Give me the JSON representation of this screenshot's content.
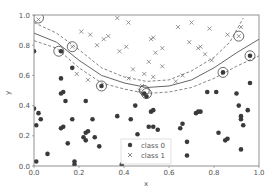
{
  "chart_data": {
    "type": "scatter",
    "title": "",
    "xlabel": "x",
    "ylabel": "y",
    "xlim": [
      0.0,
      1.0
    ],
    "ylim": [
      0.0,
      1.0
    ],
    "xticks": [
      "0.0",
      "0.2",
      "0.4",
      "0.6",
      "0.8",
      "1.0"
    ],
    "yticks": [
      "0.0",
      "0.2",
      "0.4",
      "0.6",
      "0.8",
      "1.0"
    ],
    "grid": false,
    "legend": {
      "position": "lower center",
      "entries": [
        "class 0",
        "class 1"
      ]
    },
    "series": [
      {
        "name": "class 0",
        "marker": "circle",
        "color": "#3a3a3a",
        "points": [
          [
            0.0,
            0.76
          ],
          [
            0.12,
            0.76
          ],
          [
            0.17,
            0.65
          ],
          [
            0.12,
            0.58
          ],
          [
            0.13,
            0.49
          ],
          [
            0.12,
            0.48
          ],
          [
            0.3,
            0.53
          ],
          [
            0.5,
            0.46
          ],
          [
            0.49,
            0.48
          ],
          [
            0.0,
            0.38
          ],
          [
            0.02,
            0.35
          ],
          [
            0.03,
            0.31
          ],
          [
            0.01,
            0.27
          ],
          [
            0.14,
            0.43
          ],
          [
            0.23,
            0.43
          ],
          [
            0.17,
            0.31
          ],
          [
            0.26,
            0.31
          ],
          [
            0.13,
            0.26
          ],
          [
            0.12,
            0.25
          ],
          [
            0.23,
            0.22
          ],
          [
            0.24,
            0.23
          ],
          [
            0.22,
            0.19
          ],
          [
            0.23,
            0.17
          ],
          [
            0.27,
            0.19
          ],
          [
            0.15,
            0.15
          ],
          [
            0.29,
            0.13
          ],
          [
            0.06,
            0.08
          ],
          [
            0.01,
            0.03
          ],
          [
            0.18,
            0.03
          ],
          [
            0.18,
            0.01
          ],
          [
            0.39,
            0.01
          ],
          [
            0.37,
            0.33
          ],
          [
            0.43,
            0.31
          ],
          [
            0.45,
            0.4
          ],
          [
            0.46,
            0.21
          ],
          [
            0.52,
            0.36
          ],
          [
            0.53,
            0.37
          ],
          [
            0.51,
            0.26
          ],
          [
            0.53,
            0.26
          ],
          [
            0.55,
            0.24
          ],
          [
            0.65,
            0.25
          ],
          [
            0.66,
            0.28
          ],
          [
            0.68,
            0.16
          ],
          [
            0.68,
            0.07
          ],
          [
            0.72,
            0.35
          ],
          [
            0.73,
            0.36
          ],
          [
            0.74,
            0.36
          ],
          [
            0.77,
            0.49
          ],
          [
            0.81,
            0.49
          ],
          [
            0.82,
            0.22
          ],
          [
            0.85,
            0.17
          ],
          [
            0.86,
            0.18
          ],
          [
            0.9,
            0.48
          ],
          [
            0.91,
            0.4
          ],
          [
            0.92,
            0.33
          ],
          [
            0.92,
            0.31
          ],
          [
            0.93,
            0.27
          ],
          [
            0.92,
            0.11
          ],
          [
            0.95,
            0.37
          ],
          [
            0.96,
            0.55
          ],
          [
            0.84,
            0.62
          ],
          [
            0.96,
            0.73
          ]
        ]
      },
      {
        "name": "class 1",
        "marker": "x",
        "color": "#6a6a6a",
        "points": [
          [
            0.02,
            0.97
          ],
          [
            0.17,
            0.79
          ],
          [
            0.21,
            0.89
          ],
          [
            0.25,
            0.87
          ],
          [
            0.33,
            0.86
          ],
          [
            0.41,
            0.79
          ],
          [
            0.38,
            0.76
          ],
          [
            0.44,
            0.64
          ],
          [
            0.42,
            0.58
          ],
          [
            0.28,
            0.8
          ],
          [
            0.31,
            0.84
          ],
          [
            0.37,
            0.98
          ],
          [
            0.42,
            0.95
          ],
          [
            0.52,
            0.84
          ],
          [
            0.53,
            0.85
          ],
          [
            0.54,
            0.75
          ],
          [
            0.51,
            0.69
          ],
          [
            0.57,
            0.78
          ],
          [
            0.64,
            0.92
          ],
          [
            0.7,
            0.95
          ],
          [
            0.69,
            0.82
          ],
          [
            0.73,
            0.78
          ],
          [
            0.74,
            0.79
          ],
          [
            0.76,
            0.74
          ],
          [
            0.78,
            0.91
          ],
          [
            0.57,
            0.66
          ],
          [
            0.49,
            0.61
          ],
          [
            0.66,
            0.6
          ],
          [
            0.47,
            0.5
          ],
          [
            0.92,
            0.92
          ],
          [
            0.91,
            0.86
          ],
          [
            0.86,
            0.87
          ],
          [
            0.63,
            0.56
          ],
          [
            0.79,
            0.7
          ],
          [
            0.19,
            0.61
          ],
          [
            0.24,
            0.57
          ],
          [
            0.53,
            0.59
          ],
          [
            0.48,
            0.53
          ]
        ]
      }
    ],
    "support_vectors": [
      [
        0.02,
        0.98
      ],
      [
        0.11,
        0.76
      ],
      [
        0.17,
        0.79
      ],
      [
        0.3,
        0.53
      ],
      [
        0.49,
        0.5
      ],
      [
        0.5,
        0.48
      ],
      [
        0.84,
        0.62
      ],
      [
        0.91,
        0.86
      ],
      [
        0.96,
        0.73
      ]
    ],
    "decision_boundary": {
      "style": "solid",
      "points": [
        [
          0.0,
          0.88
        ],
        [
          0.1,
          0.82
        ],
        [
          0.2,
          0.7
        ],
        [
          0.3,
          0.6
        ],
        [
          0.4,
          0.55
        ],
        [
          0.5,
          0.52
        ],
        [
          0.6,
          0.53
        ],
        [
          0.7,
          0.57
        ],
        [
          0.8,
          0.65
        ],
        [
          0.9,
          0.75
        ],
        [
          1.0,
          0.84
        ]
      ]
    },
    "margins": [
      {
        "style": "dashed",
        "points": [
          [
            0.0,
            0.95
          ],
          [
            0.1,
            0.88
          ],
          [
            0.2,
            0.77
          ],
          [
            0.3,
            0.65
          ],
          [
            0.4,
            0.59
          ],
          [
            0.5,
            0.56
          ],
          [
            0.6,
            0.57
          ],
          [
            0.7,
            0.63
          ],
          [
            0.8,
            0.72
          ],
          [
            0.87,
            0.82
          ],
          [
            0.93,
            0.98
          ]
        ]
      },
      {
        "style": "dashed",
        "points": [
          [
            0.0,
            0.83
          ],
          [
            0.1,
            0.78
          ],
          [
            0.2,
            0.65
          ],
          [
            0.3,
            0.55
          ],
          [
            0.4,
            0.51
          ],
          [
            0.5,
            0.48
          ],
          [
            0.6,
            0.49
          ],
          [
            0.7,
            0.52
          ],
          [
            0.8,
            0.58
          ],
          [
            0.9,
            0.66
          ],
          [
            1.0,
            0.73
          ]
        ]
      }
    ]
  }
}
